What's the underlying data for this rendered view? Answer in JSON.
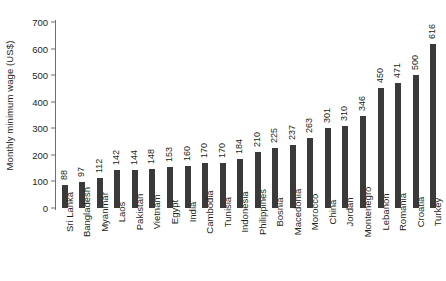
{
  "chart_data": {
    "type": "bar",
    "title": "",
    "subtitle": "",
    "xlabel": "",
    "ylabel": "Monthly minimum wage (US$)",
    "ylim": [
      0,
      700
    ],
    "yticks": [
      0,
      100,
      200,
      300,
      400,
      500,
      600,
      700
    ],
    "grid": false,
    "legend": null,
    "orientation": "vertical",
    "bar_color": "#3a3a3a",
    "background_color": "#ffffff",
    "value_labels_shown": true,
    "value_label_rotation": 90,
    "category_label_rotation": 90,
    "categories": [
      "Sri Lanka",
      "Bangladesh",
      "Myanmar",
      "Laos",
      "Pakistan",
      "Vietnam",
      "Egypt",
      "India",
      "Cambodia",
      "Tunisia",
      "Indonesia",
      "Philippines",
      "Bosnia",
      "Macedonia",
      "Morocco",
      "China",
      "Jordan",
      "Montenegro",
      "Lebanon",
      "Romania",
      "Croatia",
      "Turkey"
    ],
    "values": [
      88,
      97,
      112,
      142,
      144,
      148,
      153,
      160,
      170,
      170,
      184,
      210,
      225,
      237,
      263,
      301,
      310,
      346,
      450,
      471,
      500,
      616
    ]
  }
}
